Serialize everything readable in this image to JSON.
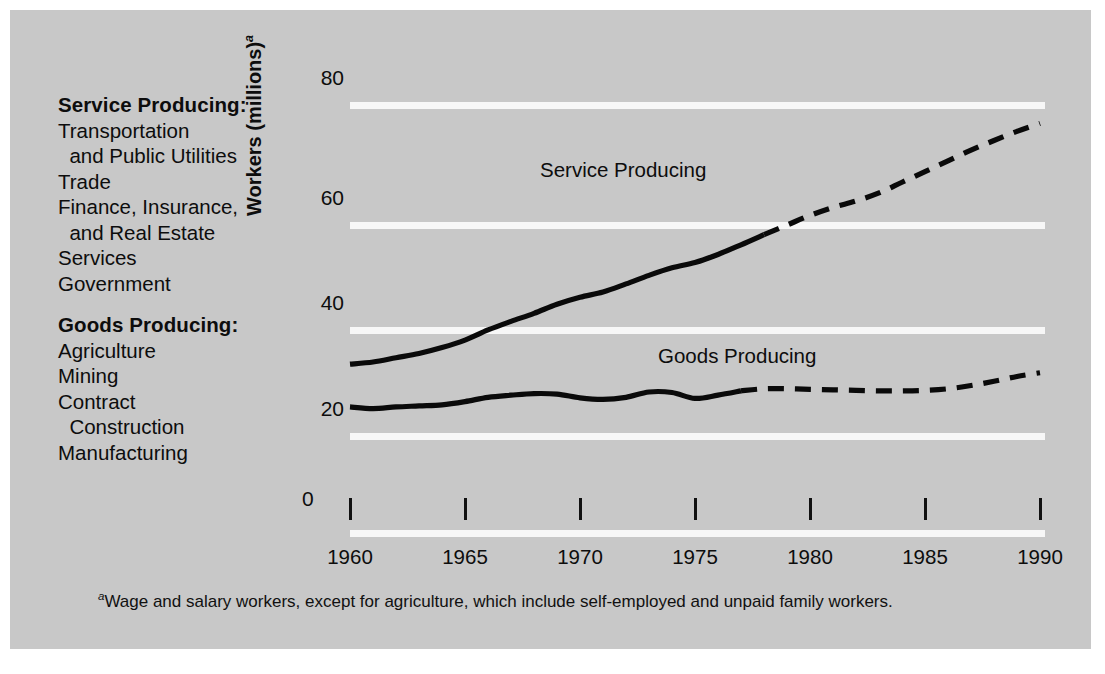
{
  "figure": {
    "panel_color": "#c8c8c8",
    "gridline_color": "#f7f7f7",
    "line_color": "#0a0a0a"
  },
  "legend": {
    "groups": [
      {
        "heading": "Service Producing:",
        "items": [
          "Transportation",
          "  and Public Utilities",
          "Trade",
          "Finance, Insurance,",
          "  and Real Estate",
          "Services",
          "Government"
        ]
      },
      {
        "heading": "Goods Producing:",
        "items": [
          "Agriculture",
          "Mining",
          "Contract",
          "  Construction",
          "Manufacturing"
        ]
      }
    ]
  },
  "axis": {
    "y_title": "Workers (millions)",
    "y_title_superscript": "a",
    "y_ticks": [
      "80",
      "60",
      "40",
      "20",
      "0"
    ],
    "x_ticks": [
      "1960",
      "1965",
      "1970",
      "1975",
      "1980",
      "1985",
      "1990"
    ]
  },
  "series_labels": {
    "service": "Service Producing",
    "goods": "Goods Producing"
  },
  "footnote": {
    "marker": "a",
    "text": "Wage and salary workers, except for agriculture, which include self-employed and unpaid family workers."
  },
  "chart_data": {
    "type": "line",
    "title": "",
    "xlabel": "",
    "ylabel": "Workers (millions)",
    "xlim": [
      1960,
      1990
    ],
    "ylim": [
      0,
      80
    ],
    "grid": true,
    "legend_position": "inline-labels",
    "x_ticks": [
      1960,
      1965,
      1970,
      1975,
      1980,
      1985,
      1990
    ],
    "y_ticks": [
      0,
      20,
      40,
      60,
      80
    ],
    "series": [
      {
        "name": "Service Producing",
        "style": "solid-then-dashed",
        "dash_starts_at": 1978,
        "note": "solid = actual through 1978, dashed = projected 1978-1990",
        "x": [
          1960,
          1961,
          1962,
          1963,
          1964,
          1965,
          1966,
          1967,
          1968,
          1969,
          1970,
          1971,
          1972,
          1973,
          1974,
          1975,
          1976,
          1977,
          1978,
          1979,
          1980,
          1981,
          1982,
          1983,
          1984,
          1985,
          1986,
          1987,
          1988,
          1989,
          1990
        ],
        "values": [
          31.0,
          31.4,
          32.2,
          33.0,
          34.1,
          35.5,
          37.4,
          39.0,
          40.5,
          42.2,
          43.5,
          44.5,
          46.0,
          47.6,
          49.0,
          50.0,
          51.5,
          53.3,
          55.2,
          57.0,
          58.8,
          60.3,
          61.5,
          63.0,
          65.0,
          67.0,
          69.0,
          71.0,
          72.8,
          74.5,
          76.0
        ]
      },
      {
        "name": "Goods Producing",
        "style": "solid-then-dashed",
        "dash_starts_at": 1977,
        "note": "solid = actual through 1977, dashed = projected 1977-1990",
        "x": [
          1960,
          1961,
          1962,
          1963,
          1964,
          1965,
          1966,
          1967,
          1968,
          1969,
          1970,
          1971,
          1972,
          1973,
          1974,
          1975,
          1976,
          1977,
          1978,
          1979,
          1980,
          1981,
          1982,
          1983,
          1984,
          1985,
          1986,
          1987,
          1988,
          1989,
          1990
        ],
        "values": [
          23.0,
          22.7,
          23.0,
          23.2,
          23.4,
          24.0,
          24.8,
          25.2,
          25.5,
          25.4,
          24.7,
          24.4,
          24.8,
          25.8,
          25.7,
          24.6,
          25.2,
          26.0,
          26.4,
          26.4,
          26.3,
          26.2,
          26.1,
          26.0,
          26.0,
          26.1,
          26.4,
          27.0,
          27.8,
          28.7,
          29.4
        ]
      }
    ]
  }
}
